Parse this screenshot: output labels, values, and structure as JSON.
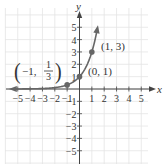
{
  "chart_data": {
    "type": "line",
    "title": "",
    "xlabel": "x",
    "ylabel": "y",
    "xlim": [
      -5.8,
      5.5
    ],
    "ylim": [
      -6,
      6
    ],
    "grid": true,
    "x_ticks": [
      -5,
      -4,
      -3,
      -2,
      -1,
      1,
      2,
      3,
      4,
      5
    ],
    "y_ticks": [
      -5,
      -4,
      -3,
      -2,
      -1,
      1,
      2,
      3,
      4,
      5
    ],
    "x_tick_labels": [
      "−5",
      "−4",
      "−3",
      "−2",
      "−1",
      "1",
      "2",
      "3",
      "4",
      "5"
    ],
    "y_tick_labels": [
      "−5",
      "−4",
      "−3",
      "−2",
      "−1",
      "1",
      "2",
      "3",
      "4",
      "5"
    ],
    "series": [
      {
        "name": "y = 3^x",
        "function": "3^x",
        "domain": [
          -5.8,
          1.6
        ],
        "color": "#666666",
        "arrows": [
          "left",
          "up"
        ]
      }
    ],
    "points": [
      {
        "x": -1,
        "y": 0.3333,
        "label": "(−1, 1/3)"
      },
      {
        "x": 0,
        "y": 1,
        "label": "(0, 1)"
      },
      {
        "x": 1,
        "y": 3,
        "label": "(1, 3)"
      }
    ],
    "annotations": {
      "p1": {
        "open": "(",
        "a": "−1,",
        "num": "1",
        "den": "3",
        "close": ")"
      },
      "p2": "(0, 1)",
      "p3": "(1, 3)"
    }
  },
  "colors": {
    "grid": "#e4e4e4",
    "axis": "#444444",
    "curve": "#666666",
    "text": "#333333"
  }
}
